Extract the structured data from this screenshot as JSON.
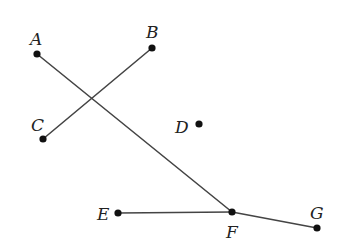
{
  "diagram": {
    "colors": {
      "line": "#444444",
      "point": "#111111",
      "label": "#222222",
      "background": "#ffffff"
    },
    "points": [
      {
        "id": "A",
        "label": "A",
        "x": 37,
        "y": 54,
        "lx": 30,
        "ly": 45
      },
      {
        "id": "B",
        "label": "B",
        "x": 152,
        "y": 48,
        "lx": 146,
        "ly": 38
      },
      {
        "id": "C",
        "label": "C",
        "x": 43,
        "y": 139,
        "lx": 31,
        "ly": 131
      },
      {
        "id": "D",
        "label": "D",
        "x": 199,
        "y": 124,
        "lx": 175,
        "ly": 133
      },
      {
        "id": "E",
        "label": "E",
        "x": 118,
        "y": 213,
        "lx": 97,
        "ly": 220
      },
      {
        "id": "F",
        "label": "F",
        "x": 232,
        "y": 212,
        "lx": 226,
        "ly": 238
      },
      {
        "id": "G",
        "label": "G",
        "x": 317,
        "y": 228,
        "lx": 310,
        "ly": 219
      }
    ],
    "segments": [
      {
        "id": "AF",
        "from": "A",
        "to": "F"
      },
      {
        "id": "BC",
        "from": "B",
        "to": "C"
      },
      {
        "id": "EF",
        "from": "E",
        "to": "F"
      },
      {
        "id": "FG",
        "from": "F",
        "to": "G"
      }
    ]
  }
}
